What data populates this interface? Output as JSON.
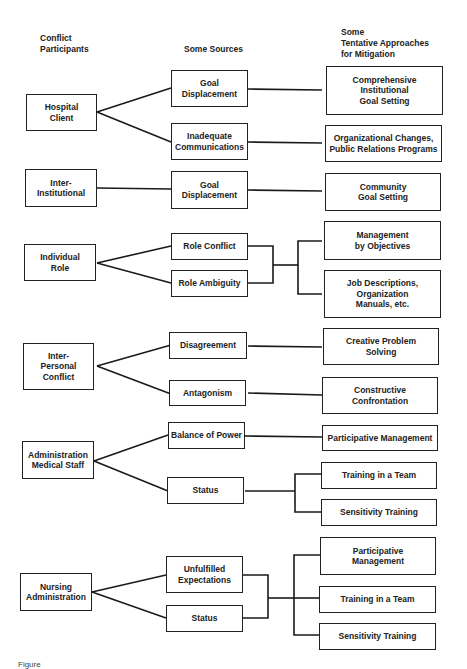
{
  "headers": {
    "participants": "Conflict\nParticipants",
    "sources": "Some Sources",
    "approaches": "Some\nTentative Approaches\nfor Mitigation"
  },
  "groups": [
    {
      "participant": "Hospital\nClient",
      "sources": [
        "Goal\nDisplacement",
        "Inadequate\nCommunications"
      ],
      "approaches": [
        "Comprehensive\nInstitutional\nGoal Setting",
        "Organizational Changes,\nPublic Relations Programs"
      ]
    },
    {
      "participant": "Inter-\nInstitutional",
      "sources": [
        "Goal\nDisplacement"
      ],
      "approaches": [
        "Community\nGoal Setting"
      ]
    },
    {
      "participant": "Individual\nRole",
      "sources": [
        "Role Conflict",
        "Role Ambiguity"
      ],
      "approaches": [
        "Management\nby Objectives",
        "Job Descriptions,\nOrganization\nManuals, etc."
      ]
    },
    {
      "participant": "Inter-\nPersonal\nConflict",
      "sources": [
        "Disagreement",
        "Antagonism"
      ],
      "approaches": [
        "Creative Problem\nSolving",
        "Constructive\nConfrontation"
      ]
    },
    {
      "participant": "Administration\nMedical Staff",
      "sources": [
        "Balance of Power",
        "Status"
      ],
      "approaches": [
        "Participative Management",
        "Training in a Team",
        "Sensitivity Training"
      ]
    },
    {
      "participant": "Nursing\nAdministration",
      "sources": [
        "Unfulfilled\nExpectations",
        "Status"
      ],
      "approaches": [
        "Participative\nManagement",
        "Training in a Team",
        "Sensitivity Training"
      ]
    }
  ],
  "caption": "Figure"
}
